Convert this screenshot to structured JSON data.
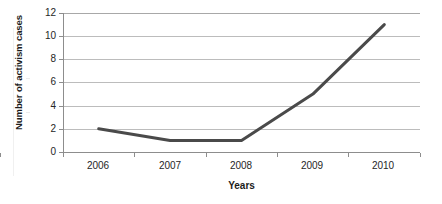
{
  "chart_data": {
    "type": "line",
    "title": "",
    "xlabel": "Years",
    "ylabel": "Number of activism cases",
    "categories": [
      "2006",
      "2007",
      "2008",
      "2009",
      "2010"
    ],
    "x": [
      2006,
      2007,
      2008,
      2009,
      2010
    ],
    "values": [
      2,
      1,
      1,
      5,
      11
    ],
    "series": [
      {
        "name": "Number of activism cases",
        "values": [
          2,
          1,
          1,
          5,
          11
        ],
        "color": "#4a4a4a",
        "marker": "none",
        "line_width": 3
      }
    ],
    "ylim": [
      0,
      12
    ],
    "yticks": [
      0,
      2,
      4,
      6,
      8,
      10,
      12
    ],
    "ytick_labels": [
      "0",
      "2",
      "4",
      "6",
      "8",
      "10",
      "12"
    ],
    "xticks": [
      2006,
      2007,
      2008,
      2009,
      2010
    ],
    "xtick_labels": [
      "2006",
      "2007",
      "2008",
      "2009",
      "2010"
    ],
    "grid": {
      "horizontal": true,
      "vertical": false,
      "color": "#bcbcbc"
    },
    "legend": {
      "visible": false,
      "position": "none"
    },
    "background": "#ffffff",
    "plot_border": "left-bottom"
  },
  "axes": {
    "y_title": "Number of activism cases",
    "x_title": "Years",
    "y_labels": [
      "12",
      "10",
      "8",
      "6",
      "4",
      "2",
      "0"
    ],
    "x_labels": [
      "2006",
      "2007",
      "2008",
      "2009",
      "2010"
    ]
  }
}
